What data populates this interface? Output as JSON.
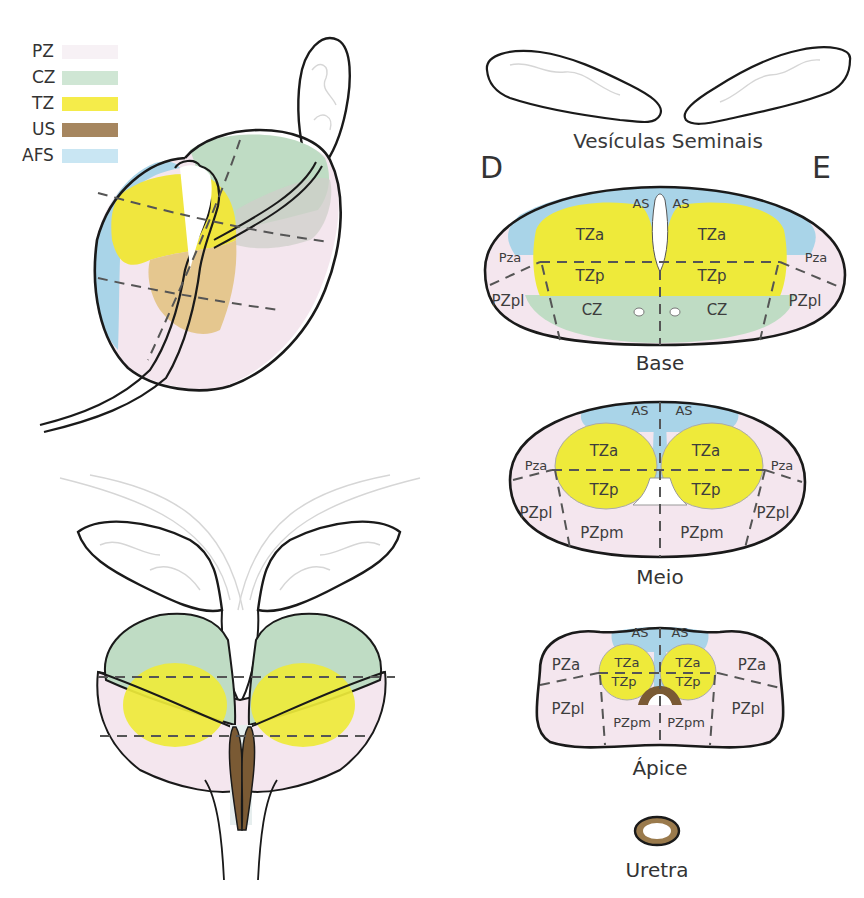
{
  "legend": {
    "items": [
      {
        "label": "PZ",
        "color": "#f7eef4",
        "name": "Zona periférica"
      },
      {
        "label": "CZ",
        "color": "#cfe6d4",
        "name": "Zona central"
      },
      {
        "label": "TZ",
        "color": "#f5ec4a",
        "name": "Zona de transição"
      },
      {
        "label": "US",
        "color": "#a6865f",
        "name": "Esfíncter uretral"
      },
      {
        "label": "AFS",
        "color": "#c9e6f3",
        "name": "Estroma fibromuscular anterior"
      }
    ]
  },
  "colors": {
    "pz": "#f4e6ee",
    "cz": "#bfdcc4",
    "tz": "#eeea3a",
    "us": "#7a5a34",
    "afs": "#a9d4e8",
    "outline": "#1a1a1a",
    "dash": "#555555"
  },
  "top_right": {
    "title": "Vesículas Seminais",
    "left_side": "D",
    "right_side": "E"
  },
  "sections": {
    "base": {
      "caption": "Base",
      "labels": {
        "as_left": "AS",
        "as_right": "AS",
        "tza_left": "TZa",
        "tza_right": "TZa",
        "tzp_left": "TZp",
        "tzp_right": "TZp",
        "pza_left": "Pza",
        "pza_right": "Pza",
        "pzpl_left": "PZpl",
        "pzpl_right": "PZpl",
        "cz_left": "CZ",
        "cz_right": "CZ"
      }
    },
    "meio": {
      "caption": "Meio",
      "labels": {
        "as_left": "AS",
        "as_right": "AS",
        "tza_left": "TZa",
        "tza_right": "TZa",
        "tzp_left": "TZp",
        "tzp_right": "TZp",
        "pza_left": "Pza",
        "pza_right": "Pza",
        "pzpl_left": "PZpl",
        "pzpl_right": "PZpl",
        "pzpm_left": "PZpm",
        "pzpm_right": "PZpm"
      }
    },
    "apice": {
      "caption": "Ápice",
      "labels": {
        "as_left": "AS",
        "as_right": "AS",
        "tza_left": "TZa",
        "tza_right": "TZa",
        "tzp_left": "TZp",
        "tzp_right": "TZp",
        "pza_left": "PZa",
        "pza_right": "PZa",
        "pzpl_left": "PZpl",
        "pzpl_right": "PZpl",
        "pzpm_left": "PZpm",
        "pzpm_right": "PZpm"
      }
    }
  },
  "urethra": {
    "caption": "Uretra"
  }
}
